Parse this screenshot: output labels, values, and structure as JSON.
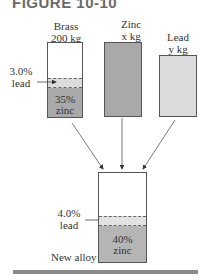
{
  "figure": {
    "title": "FIGURE 10-10"
  },
  "inputs": [
    {
      "name": "Brass",
      "amount": "200 kg",
      "lead_pct": "3.0%",
      "lead_word": "lead",
      "zinc_pct": "35%",
      "zinc_word": "zinc"
    },
    {
      "name": "Zinc",
      "amount": "x kg"
    },
    {
      "name": "Lead",
      "amount": "y kg"
    }
  ],
  "output": {
    "name": "New alloy",
    "lead_pct": "4.0%",
    "lead_word": "lead",
    "zinc_pct": "40%",
    "zinc_word": "zinc"
  },
  "colors": {
    "zinc_fill": "#a9a9a9",
    "lead_fill": "#dcdcdc",
    "mix_zinc_fill": "#b5b5b5",
    "mix_lead_fill": "#e2e2e2",
    "title": "#6a6a6a",
    "rule": "#8a8a8a"
  }
}
